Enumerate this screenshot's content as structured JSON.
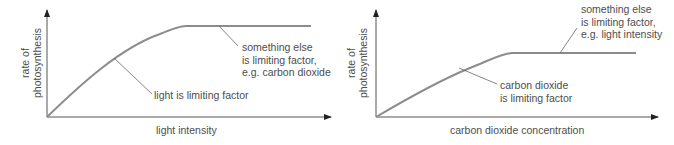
{
  "graphs": [
    {
      "id": "light",
      "y_axis_label_line1": "rate of",
      "y_axis_label_line2": "photosynthesis",
      "x_axis_label": "light intensity",
      "annotation_rising": "light is limiting factor",
      "annotation_plateau_line1": "something else",
      "annotation_plateau_line2": "is limiting factor,",
      "annotation_plateau_line3": "e.g. carbon dioxide"
    },
    {
      "id": "co2",
      "y_axis_label_line1": "rate of",
      "y_axis_label_line2": "photosynthesis",
      "x_axis_label": "carbon dioxide concentration",
      "annotation_rising_line1": "carbon dioxide",
      "annotation_rising_line2": "is limiting factor",
      "annotation_plateau_line1": "something else",
      "annotation_plateau_line2": "is limiting factor,",
      "annotation_plateau_line3": "e.g. light intensity"
    }
  ],
  "colors": {
    "curve": "#8c8c8c",
    "axis": "#555555",
    "text": "#4d4d4d"
  }
}
